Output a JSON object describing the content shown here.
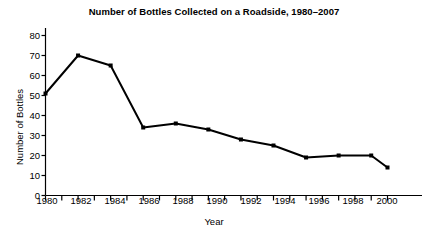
{
  "chart_data": {
    "type": "line",
    "title": "Number of Bottles Collected on a Roadside, 1980–2007",
    "xlabel": "Year",
    "ylabel": "Number of Bottles",
    "x": [
      1980,
      1982,
      1984,
      1986,
      1988,
      1990,
      1992,
      1994,
      1996,
      1998,
      2000,
      2001
    ],
    "values": [
      51,
      70,
      65,
      34,
      36,
      33,
      28,
      25,
      19,
      20,
      20,
      14
    ],
    "xlim": [
      1980,
      2001
    ],
    "ylim": [
      0,
      80
    ],
    "y_ticks": [
      0,
      10,
      20,
      30,
      40,
      50,
      60,
      70,
      80
    ],
    "x_ticks": [
      1980,
      1981,
      1982,
      1983,
      1984,
      1985,
      1986,
      1987,
      1988,
      1989,
      1990,
      1991,
      1992,
      1993,
      1994,
      1995,
      1996,
      1997,
      1998,
      1999,
      2000,
      2001
    ],
    "x_tick_labels": [
      1980,
      1982,
      1984,
      1986,
      1988,
      1990,
      1992,
      1994,
      1996,
      1998,
      2000
    ],
    "grid": false,
    "legend": null,
    "line_color": "#000000",
    "marker": "square",
    "axis_color": "#000000",
    "background": "#ffffff"
  },
  "y_ticks_text": {
    "t0": "0",
    "t1": "10",
    "t2": "20",
    "t3": "30",
    "t4": "40",
    "t5": "50",
    "t6": "60",
    "t7": "70",
    "t8": "80"
  },
  "x_ticks_text": {
    "t0": "1980",
    "t1": "1982",
    "t2": "1984",
    "t3": "1986",
    "t4": "1988",
    "t5": "1990",
    "t6": "1992",
    "t7": "1994",
    "t8": "1996",
    "t9": "1998",
    "t10": "2000"
  }
}
